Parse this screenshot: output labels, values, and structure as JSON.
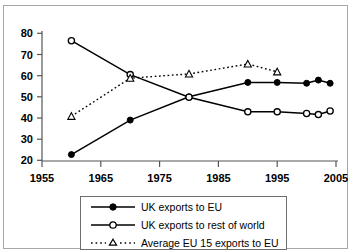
{
  "chart_data": {
    "type": "line",
    "title": "",
    "xlabel": "",
    "ylabel": "",
    "xlim": [
      1955,
      2005
    ],
    "ylim": [
      20,
      80
    ],
    "x_ticks": [
      1955,
      1965,
      1975,
      1985,
      1995,
      2005
    ],
    "y_ticks": [
      20,
      30,
      40,
      50,
      60,
      70,
      80
    ],
    "grid": false,
    "legend_position": "below-center",
    "series": [
      {
        "name": "UK exports to EU",
        "marker": "filled-circle",
        "line_style": "solid",
        "color": "#000000",
        "points": [
          {
            "x": 1960,
            "y": 22.7
          },
          {
            "x": 1970,
            "y": 39.0
          },
          {
            "x": 1980,
            "y": 50.0
          },
          {
            "x": 1990,
            "y": 56.8
          },
          {
            "x": 1995,
            "y": 56.8
          },
          {
            "x": 2000,
            "y": 56.4
          },
          {
            "x": 2002,
            "y": 57.9
          },
          {
            "x": 2004,
            "y": 56.4
          }
        ]
      },
      {
        "name": "UK exports to rest of world",
        "marker": "open-circle",
        "line_style": "solid",
        "color": "#000000",
        "points": [
          {
            "x": 1960,
            "y": 76.5
          },
          {
            "x": 1970,
            "y": 60.5
          },
          {
            "x": 1980,
            "y": 49.8
          },
          {
            "x": 1990,
            "y": 42.9
          },
          {
            "x": 1995,
            "y": 42.9
          },
          {
            "x": 2000,
            "y": 42.1
          },
          {
            "x": 2002,
            "y": 41.6
          },
          {
            "x": 2004,
            "y": 43.3
          }
        ]
      },
      {
        "name": "Average EU 15 exports to EU",
        "marker": "open-triangle",
        "line_style": "dotted",
        "color": "#000000",
        "points": [
          {
            "x": 1960,
            "y": 40.8
          },
          {
            "x": 1970,
            "y": 58.8
          },
          {
            "x": 1980,
            "y": 60.8
          },
          {
            "x": 1990,
            "y": 65.5
          },
          {
            "x": 1995,
            "y": 61.8
          }
        ]
      }
    ]
  },
  "axes": {
    "y_labels": [
      "80",
      "70",
      "60",
      "50",
      "40",
      "30",
      "20"
    ],
    "x_labels": [
      "1955",
      "1965",
      "1975",
      "1985",
      "1995",
      "2005"
    ]
  },
  "legend": {
    "items": [
      {
        "label": "UK exports to EU",
        "marker": "filled-circle",
        "style": "solid"
      },
      {
        "label": "UK exports to rest of world",
        "marker": "open-circle",
        "style": "solid"
      },
      {
        "label": "Average EU 15 exports to EU",
        "marker": "open-triangle",
        "style": "dotted"
      }
    ]
  }
}
